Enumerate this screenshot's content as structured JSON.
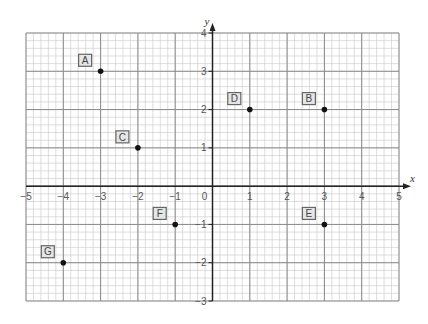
{
  "chart_data": {
    "type": "scatter",
    "title": "",
    "xlabel": "x",
    "ylabel": "y",
    "xlim": [
      -5,
      5
    ],
    "ylim": [
      -3,
      4
    ],
    "grid": true,
    "minor_subdivisions": 5,
    "x_ticks": [
      -5,
      -4,
      -3,
      -2,
      -1,
      0,
      1,
      2,
      3,
      4,
      5
    ],
    "y_ticks": [
      -3,
      -2,
      -1,
      1,
      2,
      3,
      4
    ],
    "points": [
      {
        "label": "A",
        "x": -3,
        "y": 3
      },
      {
        "label": "B",
        "x": 3,
        "y": 2
      },
      {
        "label": "C",
        "x": -2,
        "y": 1
      },
      {
        "label": "D",
        "x": 1,
        "y": 2
      },
      {
        "label": "E",
        "x": 3,
        "y": -1
      },
      {
        "label": "F",
        "x": -1,
        "y": -1
      },
      {
        "label": "G",
        "x": -4,
        "y": -2
      }
    ]
  },
  "colors": {
    "minor_grid": "#c8c8c8",
    "major_grid": "#8a8a8a",
    "axis": "#222222",
    "point": "#111111",
    "label_box": "#666666"
  },
  "layout": {
    "x_left": 26,
    "x_right": 399,
    "y_top": 33,
    "y_bottom": 301
  }
}
